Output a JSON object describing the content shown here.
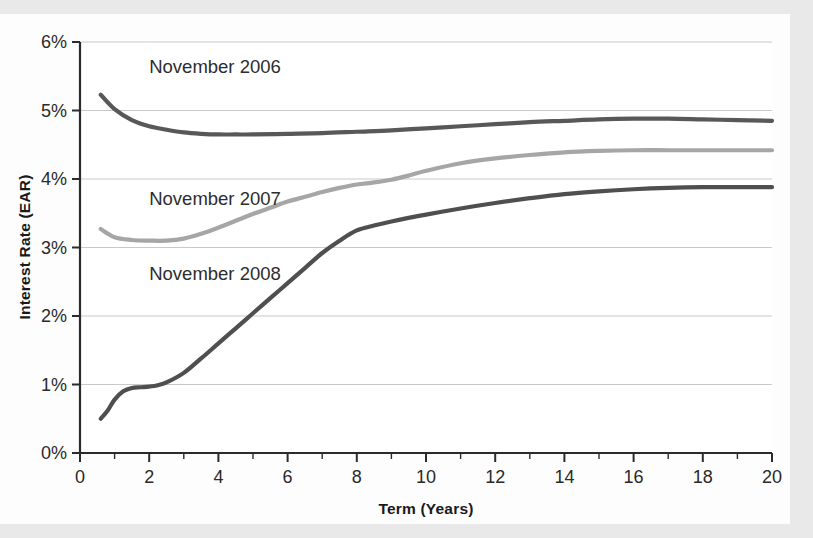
{
  "chart_data": {
    "type": "line",
    "title": "",
    "xlabel": "Term (Years)",
    "ylabel": "Interest Rate (EAR)",
    "xlim": [
      0,
      20
    ],
    "ylim": [
      0,
      6
    ],
    "grid": true,
    "legend_position": "inline-labels",
    "x_ticks": [
      0,
      2,
      4,
      6,
      8,
      10,
      12,
      14,
      16,
      18,
      20
    ],
    "x_tick_labels": [
      "0",
      "2",
      "4",
      "6",
      "8",
      "10",
      "12",
      "14",
      "16",
      "18",
      "20"
    ],
    "x_minor_tick_interval": 1,
    "y_ticks": [
      0,
      1,
      2,
      3,
      4,
      5,
      6
    ],
    "y_tick_labels": [
      "0%",
      "1%",
      "2%",
      "3%",
      "4%",
      "5%",
      "6%"
    ],
    "series": [
      {
        "name": "November 2006",
        "color": "#585858",
        "label_x": 2.0,
        "label_y": 5.55,
        "x": [
          0.6,
          1.0,
          1.5,
          2.0,
          2.5,
          3.0,
          3.5,
          4.0,
          4.5,
          5.0,
          6.0,
          7.0,
          8.0,
          9.0,
          10.0,
          11.0,
          12.0,
          13.0,
          14.0,
          15.0,
          16.0,
          17.0,
          18.0,
          19.0,
          20.0
        ],
        "y": [
          5.23,
          5.02,
          4.86,
          4.77,
          4.72,
          4.68,
          4.66,
          4.65,
          4.65,
          4.65,
          4.66,
          4.67,
          4.69,
          4.71,
          4.74,
          4.77,
          4.8,
          4.83,
          4.85,
          4.87,
          4.88,
          4.88,
          4.87,
          4.86,
          4.85
        ]
      },
      {
        "name": "November 2007",
        "color": "#a6a6a6",
        "label_x": 2.0,
        "label_y": 3.62,
        "x": [
          0.6,
          1.0,
          1.5,
          2.0,
          2.5,
          3.0,
          3.5,
          4.0,
          4.5,
          5.0,
          5.5,
          6.0,
          6.5,
          7.0,
          7.5,
          8.0,
          8.5,
          9.0,
          9.5,
          10.0,
          11.0,
          12.0,
          13.0,
          14.0,
          15.0,
          16.0,
          17.0,
          18.0,
          19.0,
          20.0
        ],
        "y": [
          3.27,
          3.15,
          3.11,
          3.1,
          3.1,
          3.13,
          3.2,
          3.29,
          3.39,
          3.49,
          3.58,
          3.67,
          3.74,
          3.81,
          3.87,
          3.92,
          3.95,
          3.99,
          4.05,
          4.12,
          4.23,
          4.3,
          4.35,
          4.39,
          4.41,
          4.42,
          4.42,
          4.42,
          4.42,
          4.42
        ]
      },
      {
        "name": "November 2008",
        "color": "#4f4f4f",
        "label_x": 2.0,
        "label_y": 2.52,
        "x": [
          0.6,
          0.8,
          1.0,
          1.25,
          1.5,
          1.75,
          2.0,
          2.25,
          2.5,
          3.0,
          3.5,
          4.0,
          4.5,
          5.0,
          5.5,
          6.0,
          6.5,
          7.0,
          7.5,
          8.0,
          8.5,
          9.0,
          10.0,
          11.0,
          12.0,
          13.0,
          14.0,
          15.0,
          16.0,
          17.0,
          18.0,
          19.0,
          20.0
        ],
        "y": [
          0.5,
          0.62,
          0.78,
          0.9,
          0.95,
          0.96,
          0.97,
          0.99,
          1.03,
          1.17,
          1.38,
          1.6,
          1.82,
          2.04,
          2.26,
          2.48,
          2.7,
          2.92,
          3.1,
          3.25,
          3.32,
          3.38,
          3.48,
          3.57,
          3.65,
          3.72,
          3.78,
          3.82,
          3.85,
          3.87,
          3.88,
          3.88,
          3.88
        ]
      }
    ]
  },
  "chart_meta": {
    "plot_background": "#ffffff",
    "grid_color": "#c9c9c9",
    "axis_color": "#2b2b2b",
    "page_background": "#e9e9e9",
    "card_background": "#fdfdfd"
  }
}
